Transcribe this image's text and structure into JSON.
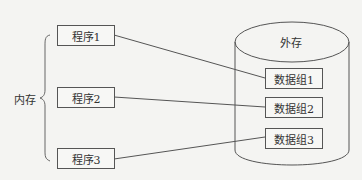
{
  "memory": {
    "label": "内存",
    "programs": [
      {
        "label": "程序1"
      },
      {
        "label": "程序2"
      },
      {
        "label": "程序3"
      }
    ]
  },
  "storage": {
    "label": "外存",
    "data_groups": [
      {
        "label": "数据组1"
      },
      {
        "label": "数据组2"
      },
      {
        "label": "数据组3"
      }
    ]
  },
  "connections": [
    {
      "from": "程序1",
      "to": "数据组1"
    },
    {
      "from": "程序2",
      "to": "数据组2"
    },
    {
      "from": "程序3",
      "to": "数据组3"
    }
  ],
  "colors": {
    "stroke": "#555555",
    "background": "#f4f4f2"
  }
}
